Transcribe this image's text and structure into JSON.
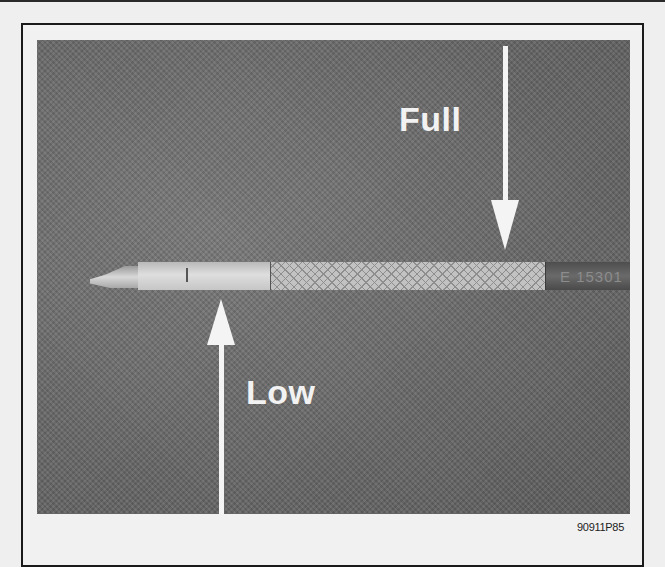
{
  "figure": {
    "id": "90911P85"
  },
  "labels": {
    "full": "Full",
    "low": "Low"
  },
  "dipstick": {
    "stamp_text": "E  15301",
    "mark_letter": "L"
  },
  "colors": {
    "page_background": "#efefef",
    "frame_border": "#1a1a1a",
    "photo_background": "#6e6e6e",
    "arrow_label": "#f4f4f4"
  }
}
